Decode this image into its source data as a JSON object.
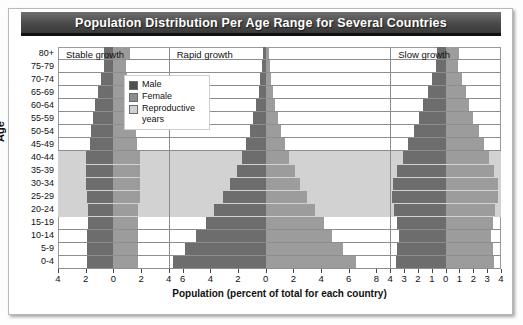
{
  "title": "Population Distribution Per Age Range for Several Countries",
  "axes": {
    "y_title": "Age",
    "x_title": "Population (percent of total for each country)"
  },
  "legend": {
    "items": [
      {
        "label": "Male",
        "color": "#4f4f4f",
        "key": "male"
      },
      {
        "label": "Female",
        "color": "#8d8d8d",
        "key": "female"
      },
      {
        "label": "Reproductive years",
        "color": "#d2d2d2",
        "key": "reproductive"
      }
    ]
  },
  "chart_data": {
    "type": "bar",
    "title": "Population Distribution Per Age Range for Several Countries",
    "xlabel": "Population (percent of total for each country)",
    "ylabel": "Age",
    "grid": true,
    "legend_position": "inside-top-left",
    "orientation": "horizontal-population-pyramid",
    "categories": [
      "0-4",
      "5-9",
      "10-14",
      "15-19",
      "20-24",
      "25-29",
      "30-34",
      "35-39",
      "40-44",
      "45-49",
      "50-54",
      "55-59",
      "60-64",
      "65-69",
      "70-74",
      "75-79",
      "80+"
    ],
    "reproductive_years_range": [
      "20-24",
      "40-44"
    ],
    "panels": [
      {
        "name": "Stable growth",
        "xlim": [
          -4,
          4
        ],
        "xticks": [
          4,
          2,
          0,
          2,
          4
        ],
        "series": [
          {
            "name": "Male",
            "values": [
              1.9,
              1.9,
              1.9,
              1.8,
              1.8,
              1.9,
              2.0,
              2.0,
              2.0,
              1.7,
              1.6,
              1.5,
              1.3,
              1.1,
              0.9,
              0.7,
              0.7
            ]
          },
          {
            "name": "Female",
            "values": [
              1.8,
              1.8,
              1.8,
              1.8,
              1.8,
              1.9,
              1.9,
              1.9,
              1.9,
              1.7,
              1.6,
              1.5,
              1.4,
              1.2,
              1.0,
              0.9,
              1.2
            ]
          }
        ]
      },
      {
        "name": "Rapid growth",
        "xlim": [
          -7,
          9
        ],
        "xticks": [
          6,
          4,
          2,
          0,
          2,
          4,
          6,
          8
        ],
        "series": [
          {
            "name": "Male",
            "values": [
              6.7,
              5.8,
              5.0,
              4.3,
              3.7,
              3.1,
              2.6,
              2.1,
              1.7,
              1.4,
              1.1,
              0.9,
              0.7,
              0.5,
              0.4,
              0.25,
              0.2
            ]
          },
          {
            "name": "Female",
            "values": [
              6.5,
              5.6,
              4.8,
              4.2,
              3.6,
              3.0,
              2.5,
              2.1,
              1.7,
              1.4,
              1.1,
              0.9,
              0.7,
              0.5,
              0.4,
              0.3,
              0.25
            ]
          }
        ]
      },
      {
        "name": "Slow growth",
        "xlim": [
          -4,
          4
        ],
        "xticks": [
          4,
          3,
          2,
          1,
          0,
          1,
          2,
          3,
          4
        ],
        "series": [
          {
            "name": "Male",
            "values": [
              3.6,
              3.5,
              3.4,
              3.5,
              3.7,
              3.9,
              3.8,
              3.5,
              3.1,
              2.7,
              2.3,
              1.9,
              1.6,
              1.3,
              1.0,
              0.7,
              0.6
            ]
          },
          {
            "name": "Female",
            "values": [
              3.5,
              3.4,
              3.3,
              3.4,
              3.6,
              3.8,
              3.8,
              3.5,
              3.1,
              2.8,
              2.4,
              2.0,
              1.7,
              1.5,
              1.2,
              0.9,
              1.0
            ]
          }
        ]
      }
    ]
  }
}
